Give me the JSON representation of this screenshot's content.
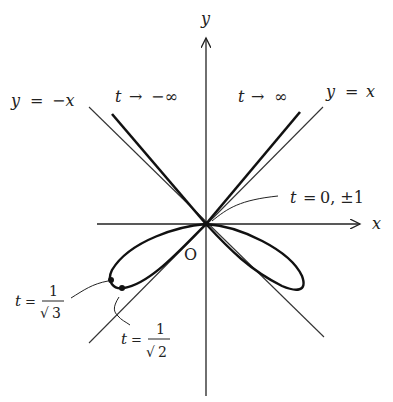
{
  "diagram": {
    "axes": {
      "x_label": "x",
      "y_label": "y",
      "origin_label": "O"
    },
    "asymptotes": {
      "positive": {
        "label_lhs": "y",
        "label_eq": "=",
        "label_rhs": "x"
      },
      "negative": {
        "label_lhs": "y",
        "label_eq": "=",
        "label_rhs": "−x"
      }
    },
    "annotations": {
      "t_neg_inf": {
        "var": "t",
        "arrow": "→",
        "value": "−∞"
      },
      "t_pos_inf": {
        "var": "t",
        "arrow": "→",
        "value": "∞"
      },
      "t_origin": {
        "var": "t",
        "eq": "=",
        "value": "0, ±1"
      },
      "t_inv_sqrt3": {
        "var": "t",
        "eq": "=",
        "num": "1",
        "den": "3",
        "radical": "√"
      },
      "t_inv_sqrt2": {
        "var": "t",
        "eq": "=",
        "num": "1",
        "den": "2",
        "radical": "√"
      }
    },
    "colors": {
      "curve": "#111111",
      "axis": "#222222",
      "asymptote": "#333333",
      "text": "#222222"
    }
  }
}
